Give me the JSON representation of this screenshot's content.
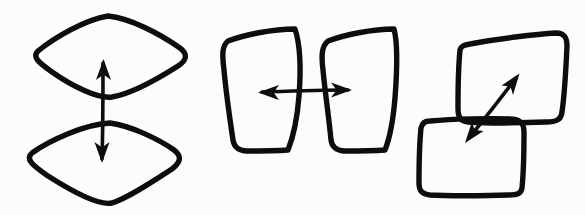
{
  "figure": {
    "medium": "black marker on white paper",
    "background_color": "#fdfdfd",
    "ink_color": "#0d0d0d",
    "shape_stroke_width": 5.4,
    "arrow_stroke_width": 3.6,
    "canvas": {
      "width": 585,
      "height": 215
    }
  },
  "groups": [
    {
      "id": "group-left",
      "name": "vertical-pair",
      "relation": "above-below",
      "arrow": {
        "name": "vertical-double-arrow",
        "orientation": "vertical",
        "heads": "double",
        "x1": 102,
        "y1": 160,
        "x2": 104,
        "y2": 62
      },
      "shapes": [
        {
          "id": "shape-top-diamond",
          "name": "diamond-top",
          "kind": "diamond",
          "position": "top",
          "bbox": {
            "x": 34,
            "y": 14,
            "width": 152,
            "height": 88
          },
          "path": "M 108 16 C 130 18 160 34 180 48 C 188 54 187 60 178 66 C 156 80 130 94 112 97 C 98 99 72 86 52 72 C 38 62 32 57 38 51 C 54 38 84 20 108 16 Z"
        },
        {
          "id": "shape-bottom-diamond",
          "name": "diamond-bottom",
          "kind": "diamond",
          "position": "bottom",
          "bbox": {
            "x": 25,
            "y": 120,
            "width": 156,
            "height": 85
          },
          "path": "M 110 123 C 132 126 160 140 174 150 C 182 156 181 162 172 169 C 152 182 128 198 112 203 C 99 206 70 190 48 176 C 32 165 25 159 32 153 C 50 140 86 124 110 123 Z"
        }
      ]
    },
    {
      "id": "group-middle",
      "name": "horizontal-pair",
      "relation": "left-right",
      "arrow": {
        "name": "horizontal-double-arrow",
        "orientation": "horizontal",
        "heads": "double",
        "x1": 259,
        "y1": 92,
        "x2": 351,
        "y2": 90
      },
      "shapes": [
        {
          "id": "shape-left-parallelogram",
          "name": "parallelogram-left",
          "kind": "parallelogram",
          "position": "left",
          "bbox": {
            "x": 221,
            "y": 26,
            "width": 81,
            "height": 127
          },
          "path": "M 295 29 C 300 44 301 70 299 96 C 297 122 292 140 288 150 C 274 151 256 151 246 151 C 238 150 234 147 233 140 C 230 120 226 92 224 70 C 222 54 222 46 228 41 C 244 35 272 29 295 29 Z"
        },
        {
          "id": "shape-right-parallelogram",
          "name": "parallelogram-right",
          "kind": "parallelogram",
          "position": "right",
          "bbox": {
            "x": 320,
            "y": 26,
            "width": 79,
            "height": 127
          },
          "path": "M 394 29 C 398 44 397 72 395 98 C 393 122 389 140 385 150 C 371 151 353 151 344 151 C 336 150 332 147 331 140 C 329 118 325 92 323 70 C 321 54 322 46 328 41 C 344 35 372 29 394 29 Z"
        }
      ]
    },
    {
      "id": "group-right",
      "name": "diagonal-pair",
      "relation": "diagonal-offset",
      "arrow": {
        "name": "diagonal-double-arrow",
        "orientation": "diagonal",
        "heads": "double",
        "x1": 466,
        "y1": 142,
        "x2": 519,
        "y2": 74
      },
      "shapes": [
        {
          "id": "shape-upper-rectangle",
          "name": "rectangle-upper-right",
          "kind": "rectangle",
          "position": "upper-right",
          "bbox": {
            "x": 456,
            "y": 31,
            "width": 112,
            "height": 95
          },
          "path": "M 470 44 C 494 39 538 34 556 33 C 564 33 567 37 567 46 C 566 68 564 98 562 112 C 561 120 556 122 546 122 C 520 123 484 123 468 122 C 460 121 458 117 458 108 C 458 88 459 60 460 50 C 461 46 464 45 470 44 Z"
        },
        {
          "id": "shape-lower-rectangle",
          "name": "rectangle-lower-left",
          "kind": "rectangle",
          "position": "lower-left",
          "bbox": {
            "x": 416,
            "y": 116,
            "width": 110,
            "height": 81
          },
          "path": "M 430 121 C 452 119 492 118 510 119 C 520 119 524 123 524 132 C 524 150 523 178 522 188 C 521 194 517 195 508 195 C 484 196 444 196 430 195 C 422 194 419 191 419 183 C 419 166 420 138 421 128 C 422 123 425 121 430 121 Z"
        }
      ]
    }
  ]
}
